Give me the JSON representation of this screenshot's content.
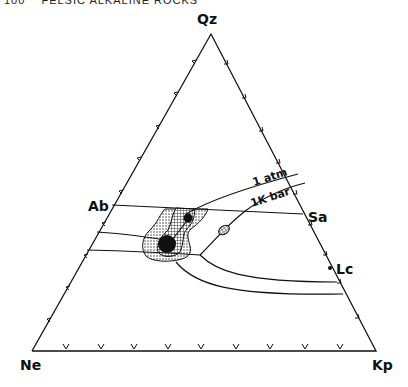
{
  "header": {
    "page_number": "100",
    "running_title": "FELSIC ALKALINE ROCKS"
  },
  "diagram": {
    "type": "ternary phase diagram",
    "apices": {
      "top": "Qz",
      "bottom_left": "Ne",
      "bottom_right": "Kp"
    },
    "side_points": {
      "left": "Ab",
      "right_upper": "Sa",
      "right_lower": "Lc"
    },
    "curve_labels": {
      "upper": "1 atm",
      "lower": "1K bar"
    },
    "features": [
      "field boundary Ab–Sa",
      "cotectic curves 1 atm and 1 Kbar",
      "stippled and cross-hatched data fields",
      "large solid dot (minimum)",
      "small solid dot",
      "small cross-hatched ellipse"
    ],
    "colors": {
      "ink": "#111111",
      "background": "#ffffff"
    }
  }
}
